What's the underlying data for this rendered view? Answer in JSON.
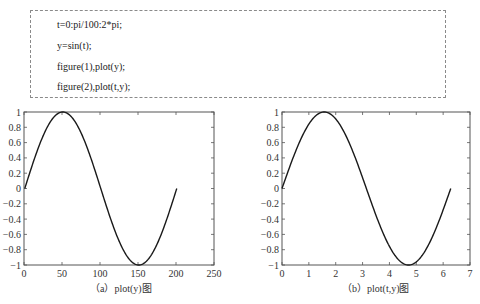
{
  "code": {
    "lines": [
      "t=0:pi/100:2*pi;",
      "y=sin(t);",
      "figure(1),plot(y);",
      "figure(2),plot(t,y);"
    ]
  },
  "captions": {
    "left": "（a）plot(y)图",
    "right": "（b）plot(t,y)图"
  },
  "colors": {
    "line": "#1a1a1a",
    "axes": "#555555",
    "code_border": "#8a8a8a"
  },
  "chart_data": [
    {
      "type": "line",
      "title": "",
      "caption": "（a）plot(y)图",
      "xlabel": "",
      "ylabel": "",
      "xlim": [
        0,
        250
      ],
      "ylim": [
        -1,
        1
      ],
      "xticks": [
        0,
        50,
        100,
        150,
        200,
        250
      ],
      "yticks": [
        -1,
        -0.8,
        -0.6,
        -0.4,
        -0.2,
        0,
        0.2,
        0.4,
        0.6,
        0.8,
        1
      ],
      "ytick_labels": [
        "−1",
        "−0.8",
        "−0.6",
        "−0.4",
        "−0.2",
        "0",
        "0.2",
        "0.4",
        "0.6",
        "0.8",
        "1"
      ],
      "grid": false,
      "series": [
        {
          "name": "y=sin(t) vs index",
          "function": "sin(2*pi*(i-1)/200)",
          "x_range": [
            1,
            201
          ],
          "points": 201,
          "key_points": [
            [
              1,
              0
            ],
            [
              51,
              1
            ],
            [
              101,
              0
            ],
            [
              151,
              -1
            ],
            [
              201,
              0
            ]
          ]
        }
      ]
    },
    {
      "type": "line",
      "title": "",
      "caption": "（b）plot(t,y)图",
      "xlabel": "",
      "ylabel": "",
      "xlim": [
        0,
        7
      ],
      "ylim": [
        -1,
        1
      ],
      "xticks": [
        0,
        1,
        2,
        3,
        4,
        5,
        6,
        7
      ],
      "yticks": [
        -1,
        -0.8,
        -0.6,
        -0.4,
        -0.2,
        0,
        0.2,
        0.4,
        0.6,
        0.8,
        1
      ],
      "ytick_labels": [
        "−1",
        "−0.8",
        "−0.6",
        "−0.4",
        "−0.2",
        "0",
        "0.2",
        "0.4",
        "0.6",
        "0.8",
        "1"
      ],
      "grid": false,
      "series": [
        {
          "name": "y=sin(t)",
          "function": "sin(t)",
          "x_range": [
            0,
            6.2832
          ],
          "points": 201,
          "key_points": [
            [
              0,
              0
            ],
            [
              1.5708,
              1
            ],
            [
              3.1416,
              0
            ],
            [
              4.7124,
              -1
            ],
            [
              6.2832,
              0
            ]
          ]
        }
      ]
    }
  ]
}
